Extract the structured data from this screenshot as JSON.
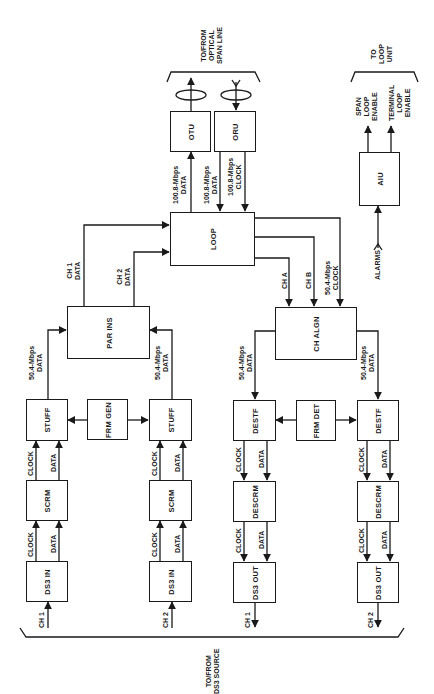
{
  "blocks": {
    "otu": "OTU",
    "oru": "ORU",
    "loop": "LOOP",
    "aiu": "AIU",
    "par_ins": "PAR INS",
    "ch_algn": "CH ALGN",
    "stuff1": "STUFF",
    "frm_gen": "FRM GEN",
    "stuff2": "STUFF",
    "destf1": "DESTF",
    "frm_det": "FRM DET",
    "destf2": "DESTF",
    "scrm1": "SCRM",
    "scrm2": "SCRM",
    "descrm1": "DESCRM",
    "descrm2": "DESCRM",
    "ds3in1": "DS3 IN",
    "ds3in2": "DS3 IN",
    "ds3out1": "DS3 OUT",
    "ds3out2": "DS3 OUT"
  },
  "labels": {
    "optical": "TO/FROM\nOPTICAL\nSPAN LINE",
    "loop_unit": "TO\nLOOP\nUNIT",
    "ds3_source": "TO/FROM\nDS3 SOURCE",
    "span_loop_enable": "SPAN\nLOOP\nENABLE",
    "terminal_loop_enable": "TERMINAL\nLOOP\nENABLE",
    "alarms": "ALARMS",
    "otu_data": "100.8-Mbps\nDATA",
    "oru_data": "100.8-Mbps\nDATA",
    "oru_clock": "100.8-Mbps\nCLOCK",
    "ch1_data": "CH 1\nDATA",
    "ch2_data": "CH 2\nDATA",
    "ch_a": "CH A",
    "ch_b": "CH B",
    "algn_clock": "50.4-Mbps\nCLOCK",
    "stuff1_data": "50.4-Mbps\nDATA",
    "stuff2_data": "50.4-Mbps\nDATA",
    "destf1_data": "50.4-Mbps\nDATA",
    "destf2_data": "50.4-Mbps\nDATA",
    "clock": "CLOCK",
    "data": "DATA",
    "ch1": "CH 1",
    "ch2": "CH 2"
  }
}
